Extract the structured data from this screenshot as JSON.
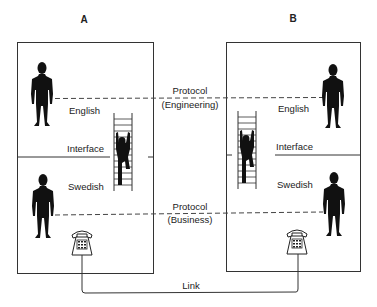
{
  "diagram": {
    "type": "communication-layers",
    "nodes": {
      "a": {
        "label": "A"
      },
      "b": {
        "label": "B"
      }
    },
    "layers": {
      "upper_language": "English",
      "interface": "Interface",
      "lower_language": "Swedish"
    },
    "protocols": {
      "engineering": {
        "line1": "Protocol",
        "line2": "(Engineering)"
      },
      "business": {
        "line1": "Protocol",
        "line2": "(Business)"
      }
    },
    "link": {
      "label": "Link"
    },
    "icons": [
      "person-icon",
      "climbing-person-ladder-icon",
      "telephone-icon"
    ],
    "colors": {
      "line": "#333333",
      "figure": "#111111",
      "background": "#ffffff"
    }
  }
}
